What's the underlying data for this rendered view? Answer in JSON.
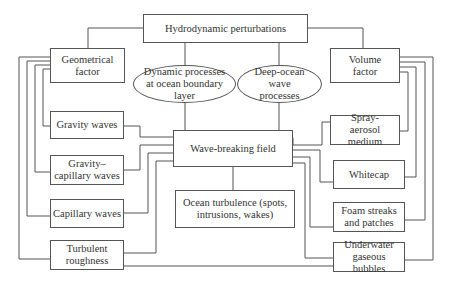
{
  "diagram": {
    "top": "Hydrodynamic perturbations",
    "left_factor": "Geometrical factor",
    "right_factor": "Volume factor",
    "ellipse_left": "Dynamic processes at ocean boundary layer",
    "ellipse_right": "Deep-ocean wave processes",
    "center": "Wave-breaking field",
    "turbulence": "Ocean turbulence (spots, intrusions, wakes)",
    "left_items": [
      "Gravity waves",
      "Gravity–capillary waves",
      "Capillary waves",
      "Turbulent roughness"
    ],
    "right_items": [
      "Spray-aerosol medium",
      "Whitecap",
      "Foam streaks and patches",
      "Underwater gaseous bubbles"
    ]
  }
}
